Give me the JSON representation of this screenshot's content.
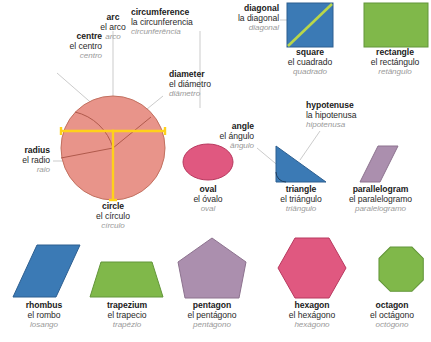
{
  "diagram": {
    "languages": [
      "English",
      "Spanish",
      "Portuguese"
    ],
    "background_color": "#ffffff"
  },
  "colors": {
    "circle_fill": "#e8948a",
    "circle_stroke": "#c2705f",
    "circle_marker": "#ffd11a",
    "oval_fill": "#e05880",
    "oval_stroke": "#b8395f",
    "square_fill": "#3b7ab5",
    "square_stroke": "#2d5f90",
    "square_diagonal": "#b9d64a",
    "rectangle_fill": "#80b84a",
    "rectangle_stroke": "#63963a",
    "triangle_fill": "#3b7ab5",
    "triangle_stroke": "#2d5f90",
    "parallelogram_fill": "#ab8fae",
    "parallelogram_stroke": "#8d738f",
    "rhombus_fill": "#3b7ab5",
    "rhombus_stroke": "#2d5f90",
    "trapezium_fill": "#80b84a",
    "trapezium_stroke": "#63963a",
    "pentagon_fill": "#ab8fae",
    "pentagon_stroke": "#8d738f",
    "hexagon_fill": "#e05880",
    "hexagon_stroke": "#b8395f",
    "octagon_fill": "#80b84a",
    "octagon_stroke": "#63963a",
    "leader_line": "#b5b5b5",
    "text_primary": "#1b1b1b",
    "text_secondary": "#2a2a2a",
    "text_muted": "#9a9a9a"
  },
  "parts": [
    {
      "id": "centre",
      "en": "centre",
      "es": "el centro",
      "pt": "centro"
    },
    {
      "id": "arc",
      "en": "arc",
      "es": "el arco",
      "pt": "arco"
    },
    {
      "id": "circumference",
      "en": "circumference",
      "es": "la circunferencia",
      "pt": "circunferência"
    },
    {
      "id": "diameter",
      "en": "diameter",
      "es": "el diámetro",
      "pt": "diâmetro"
    },
    {
      "id": "radius",
      "en": "radius",
      "es": "el radio",
      "pt": "raio"
    },
    {
      "id": "diagonal",
      "en": "diagonal",
      "es": "la diagonal",
      "pt": "diagonal"
    },
    {
      "id": "angle",
      "en": "angle",
      "es": "el ángulo",
      "pt": "ângulo"
    },
    {
      "id": "hypotenuse",
      "en": "hypotenuse",
      "es": "la hipotenusa",
      "pt": "hipotenusa"
    }
  ],
  "shapes": [
    {
      "id": "square",
      "en": "square",
      "es": "el cuadrado",
      "pt": "quadrado"
    },
    {
      "id": "rectangle",
      "en": "rectangle",
      "es": "el rectángulo",
      "pt": "retângulo"
    },
    {
      "id": "circle",
      "en": "circle",
      "es": "el círculo",
      "pt": "círculo"
    },
    {
      "id": "oval",
      "en": "oval",
      "es": "el óvalo",
      "pt": "oval"
    },
    {
      "id": "triangle",
      "en": "triangle",
      "es": "el triángulo",
      "pt": "triângulo"
    },
    {
      "id": "parallelogram",
      "en": "parallelogram",
      "es": "el paralelogramo",
      "pt": "paralelogramo"
    },
    {
      "id": "rhombus",
      "en": "rhombus",
      "es": "el rombo",
      "pt": "losango"
    },
    {
      "id": "trapezium",
      "en": "trapezium",
      "es": "el trapecio",
      "pt": "trapézio"
    },
    {
      "id": "pentagon",
      "en": "pentagon",
      "es": "el pentágono",
      "pt": "pentágono"
    },
    {
      "id": "hexagon",
      "en": "hexagon",
      "es": "el hexágono",
      "pt": "hexágono"
    },
    {
      "id": "octagon",
      "en": "octagon",
      "es": "el octágono",
      "pt": "octógono"
    }
  ]
}
